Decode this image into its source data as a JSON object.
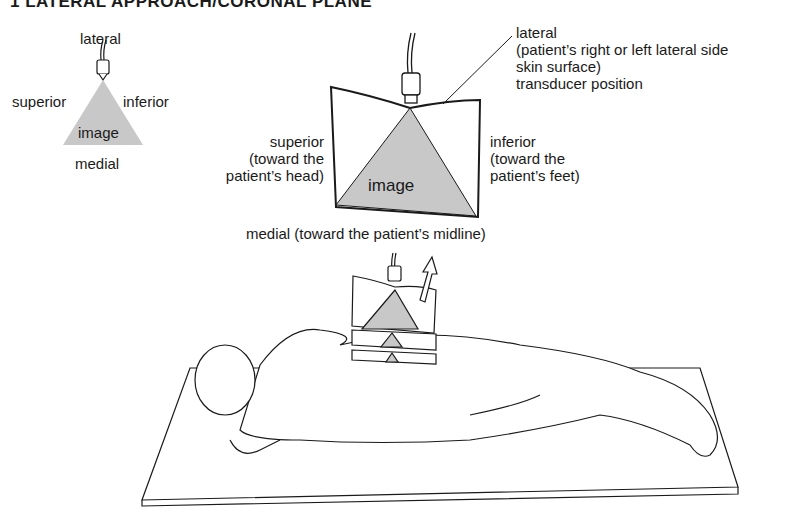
{
  "title": "1 LATERAL APPROACH/CORONAL PLANE",
  "small_diagram": {
    "top": "lateral",
    "left": "superior",
    "right": "inferior",
    "center": "image",
    "bottom": "medial"
  },
  "large_diagram": {
    "top_label": [
      "lateral",
      "(patient’s right or left lateral side",
      "skin surface)",
      "transducer position"
    ],
    "left_label": [
      "superior",
      "(toward the",
      "patient’s head)"
    ],
    "right_label": [
      "inferior",
      "(toward the",
      "patient’s feet)"
    ],
    "center": "image",
    "bottom_label": "medial (toward the patient’s midline)"
  },
  "colors": {
    "image_fill": "#c8c8c8",
    "line": "#1a1a1a"
  },
  "icons": [
    "transducer-icon",
    "direction-arrow-icon",
    "patient-illustration",
    "exam-table-illustration"
  ]
}
